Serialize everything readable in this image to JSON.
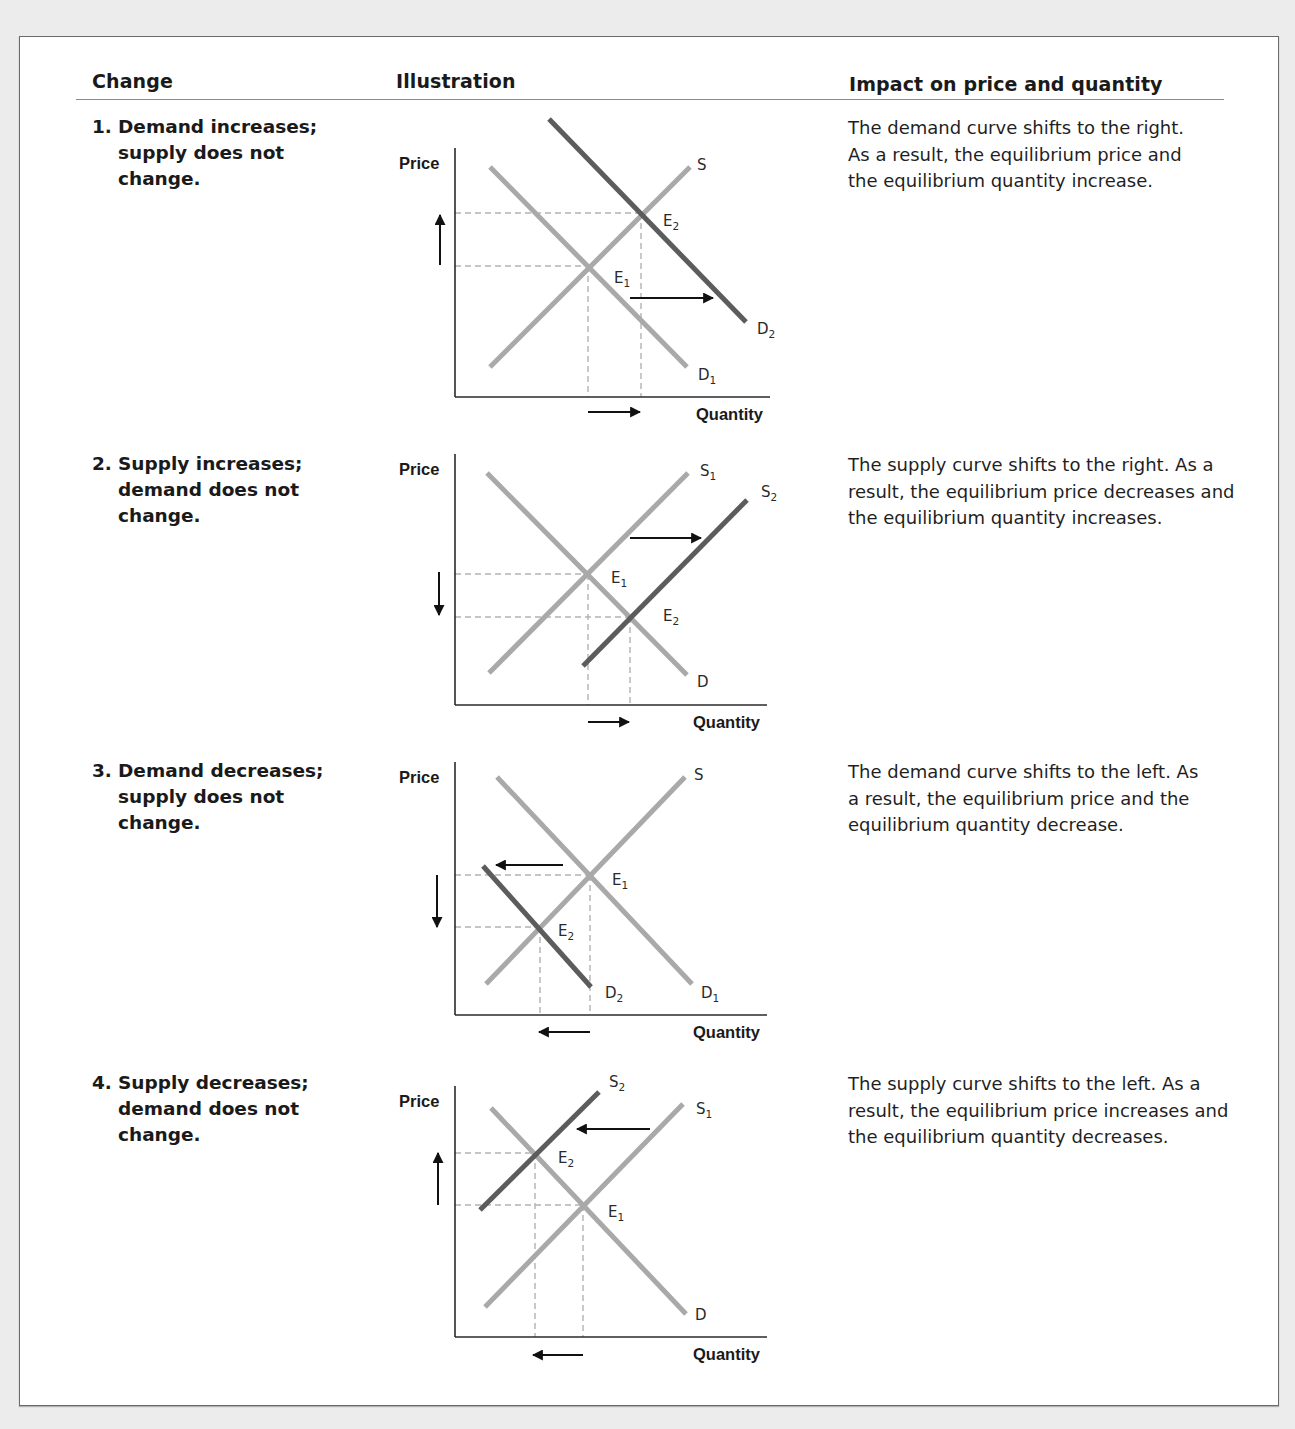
{
  "table": {
    "headers": {
      "change": "Change",
      "illustration": "Illustration",
      "impact": "Impact on price and quantity"
    },
    "rows": [
      {
        "number": "1.",
        "change": "Demand increases; supply does not change.",
        "change_lines": [
          "Demand increases;",
          "supply does not",
          "change."
        ],
        "impact": "The demand curve shifts to the right. As a result, the equilibrium price and the equilibrium quantity increase."
      },
      {
        "number": "2.",
        "change": "Supply increases; demand does not change.",
        "change_lines": [
          "Supply increases;",
          "demand does not",
          "change."
        ],
        "impact": "The supply curve shifts to the right. As a result, the equilibrium price decreases and the equilibrium quantity increases."
      },
      {
        "number": "3.",
        "change": "Demand decreases; supply does not change.",
        "change_lines": [
          "Demand decreases;",
          "supply does not",
          "change."
        ],
        "impact": "The demand curve shifts to the left. As a result, the equilibrium price and the equilibrium quantity decrease."
      },
      {
        "number": "4.",
        "change": "Supply decreases; demand does not change.",
        "change_lines": [
          "Supply decreases;",
          "demand does not",
          "change."
        ],
        "impact": "The supply curve shifts to the left. As a result, the equilibrium price increases and the equilibrium quantity decreases."
      }
    ]
  },
  "colors": {
    "panel_border": "#6a6a6a",
    "page_bg": "#ececec",
    "original_curve": "#a9a9a9",
    "shifted_curve": "#5c5c5c",
    "guide_dashes": "#b3b3b3",
    "axis": "#2a2a2a",
    "arrow": "#111111"
  },
  "chart_data": [
    {
      "type": "line",
      "title": "Demand increases; supply does not change",
      "xlabel": "Quantity",
      "ylabel": "Price",
      "axis": {
        "x0": 455,
        "y_top": 148,
        "y0": 397,
        "x_end": 770
      },
      "curves": [
        {
          "name": "S",
          "base": "S",
          "sub": "",
          "role": "original",
          "x1": 490,
          "y1": 367,
          "x2": 690,
          "y2": 167,
          "lx": 697,
          "ly": 170
        },
        {
          "name": "D1",
          "base": "D",
          "sub": "1",
          "role": "original",
          "x1": 490,
          "y1": 167,
          "x2": 687,
          "y2": 367,
          "lx": 698,
          "ly": 380
        },
        {
          "name": "D2",
          "base": "D",
          "sub": "2",
          "role": "shifted",
          "x1": 549,
          "y1": 119,
          "x2": 746,
          "y2": 322,
          "lx": 757,
          "ly": 334
        }
      ],
      "equilibria": [
        {
          "name": "E1",
          "base": "E",
          "sub": "1",
          "x": 588,
          "y": 266,
          "lx": 614,
          "ly": 283
        },
        {
          "name": "E2",
          "base": "E",
          "sub": "2",
          "x": 641,
          "y": 213,
          "lx": 663,
          "ly": 226
        }
      ],
      "arrows": [
        {
          "meaning": "price-up",
          "x1": 440,
          "y1": 265,
          "x2": 440,
          "y2": 215
        },
        {
          "meaning": "demand-shift-right",
          "x1": 630,
          "y1": 298,
          "x2": 713,
          "y2": 298
        },
        {
          "meaning": "quantity-up",
          "x1": 588,
          "y1": 412,
          "x2": 640,
          "y2": 412
        }
      ],
      "result": {
        "price": "increase",
        "quantity": "increase"
      }
    },
    {
      "type": "line",
      "title": "Supply increases; demand does not change",
      "xlabel": "Quantity",
      "ylabel": "Price",
      "axis": {
        "x0": 455,
        "y_top": 454,
        "y0": 705,
        "x_end": 767
      },
      "curves": [
        {
          "name": "S1",
          "base": "S",
          "sub": "1",
          "role": "original",
          "x1": 489,
          "y1": 673,
          "x2": 688,
          "y2": 473,
          "lx": 700,
          "ly": 476
        },
        {
          "name": "S2",
          "base": "S",
          "sub": "2",
          "role": "shifted",
          "x1": 583,
          "y1": 666,
          "x2": 747,
          "y2": 500,
          "lx": 761,
          "ly": 497
        },
        {
          "name": "D",
          "base": "D",
          "sub": "",
          "role": "original",
          "x1": 487,
          "y1": 473,
          "x2": 687,
          "y2": 675,
          "lx": 697,
          "ly": 687
        }
      ],
      "equilibria": [
        {
          "name": "E1",
          "base": "E",
          "sub": "1",
          "x": 588,
          "y": 574,
          "lx": 611,
          "ly": 583
        },
        {
          "name": "E2",
          "base": "E",
          "sub": "2",
          "x": 630,
          "y": 617,
          "lx": 663,
          "ly": 621
        }
      ],
      "arrows": [
        {
          "meaning": "price-down",
          "x1": 439,
          "y1": 572,
          "x2": 439,
          "y2": 615
        },
        {
          "meaning": "supply-shift-right",
          "x1": 630,
          "y1": 538,
          "x2": 701,
          "y2": 538
        },
        {
          "meaning": "quantity-up",
          "x1": 588,
          "y1": 722,
          "x2": 629,
          "y2": 722
        }
      ],
      "result": {
        "price": "decrease",
        "quantity": "increase"
      }
    },
    {
      "type": "line",
      "title": "Demand decreases; supply does not change",
      "xlabel": "Quantity",
      "ylabel": "Price",
      "axis": {
        "x0": 455,
        "y_top": 762,
        "y0": 1015,
        "x_end": 767
      },
      "curves": [
        {
          "name": "S",
          "base": "S",
          "sub": "",
          "role": "original",
          "x1": 486,
          "y1": 984,
          "x2": 685,
          "y2": 777,
          "lx": 694,
          "ly": 780
        },
        {
          "name": "D1",
          "base": "D",
          "sub": "1",
          "role": "original",
          "x1": 497,
          "y1": 777,
          "x2": 692,
          "y2": 984,
          "lx": 701,
          "ly": 998
        },
        {
          "name": "D2",
          "base": "D",
          "sub": "2",
          "role": "shifted",
          "x1": 483,
          "y1": 866,
          "x2": 591,
          "y2": 987,
          "lx": 605,
          "ly": 998
        }
      ],
      "equilibria": [
        {
          "name": "E1",
          "base": "E",
          "sub": "1",
          "x": 590,
          "y": 875,
          "lx": 612,
          "ly": 885
        },
        {
          "name": "E2",
          "base": "E",
          "sub": "2",
          "x": 540,
          "y": 927,
          "lx": 558,
          "ly": 936
        }
      ],
      "arrows": [
        {
          "meaning": "price-down",
          "x1": 437,
          "y1": 875,
          "x2": 437,
          "y2": 927
        },
        {
          "meaning": "demand-shift-left",
          "x1": 563,
          "y1": 865,
          "x2": 496,
          "y2": 865
        },
        {
          "meaning": "quantity-down",
          "x1": 590,
          "y1": 1032,
          "x2": 539,
          "y2": 1032
        }
      ],
      "result": {
        "price": "decrease",
        "quantity": "decrease"
      }
    },
    {
      "type": "line",
      "title": "Supply decreases; demand does not change",
      "xlabel": "Quantity",
      "ylabel": "Price",
      "axis": {
        "x0": 455,
        "y_top": 1086,
        "y0": 1337,
        "x_end": 767
      },
      "curves": [
        {
          "name": "S1",
          "base": "S",
          "sub": "1",
          "role": "original",
          "x1": 485,
          "y1": 1307,
          "x2": 683,
          "y2": 1104,
          "lx": 696,
          "ly": 1114
        },
        {
          "name": "S2",
          "base": "S",
          "sub": "2",
          "role": "shifted",
          "x1": 480,
          "y1": 1210,
          "x2": 599,
          "y2": 1092,
          "lx": 609,
          "ly": 1087
        },
        {
          "name": "D",
          "base": "D",
          "sub": "",
          "role": "original",
          "x1": 491,
          "y1": 1108,
          "x2": 686,
          "y2": 1314,
          "lx": 695,
          "ly": 1320
        }
      ],
      "equilibria": [
        {
          "name": "E1",
          "base": "E",
          "sub": "1",
          "x": 583,
          "y": 1205,
          "lx": 608,
          "ly": 1217
        },
        {
          "name": "E2",
          "base": "E",
          "sub": "2",
          "x": 535,
          "y": 1153,
          "lx": 558,
          "ly": 1163
        }
      ],
      "arrows": [
        {
          "meaning": "price-up",
          "x1": 438,
          "y1": 1205,
          "x2": 438,
          "y2": 1153
        },
        {
          "meaning": "supply-shift-left",
          "x1": 650,
          "y1": 1129,
          "x2": 577,
          "y2": 1129
        },
        {
          "meaning": "quantity-down",
          "x1": 583,
          "y1": 1355,
          "x2": 533,
          "y2": 1355
        }
      ],
      "result": {
        "price": "increase",
        "quantity": "decrease"
      }
    }
  ]
}
